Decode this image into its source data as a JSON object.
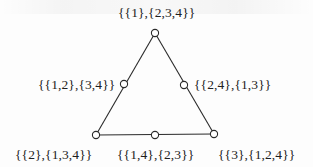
{
  "diagram": {
    "type": "triangle-graph",
    "colors": {
      "line": "#2a2a2a",
      "node_fill": "#ffffff",
      "text": "#1e1e1e",
      "background": "#fdfdfd"
    },
    "nodes": [
      {
        "id": "top",
        "label": "{{1},{2,3,4}}",
        "x": 155,
        "y": 33
      },
      {
        "id": "left-mid",
        "label": "{{1,2},{3,4}}",
        "x": 124,
        "y": 84
      },
      {
        "id": "right-mid",
        "label": "{{2,4},{1,3}}",
        "x": 184,
        "y": 85
      },
      {
        "id": "bottom-left",
        "label": "{{2},{1,3,4}}",
        "x": 96,
        "y": 135
      },
      {
        "id": "bottom-mid",
        "label": "{{1,4},{2,3}}",
        "x": 155,
        "y": 135
      },
      {
        "id": "bottom-right",
        "label": "{{3},{1,2,4}}",
        "x": 214,
        "y": 134
      }
    ],
    "edges": [
      {
        "from": "top",
        "to": "bottom-left"
      },
      {
        "from": "top",
        "to": "bottom-right"
      },
      {
        "from": "bottom-left",
        "to": "bottom-right"
      }
    ]
  }
}
